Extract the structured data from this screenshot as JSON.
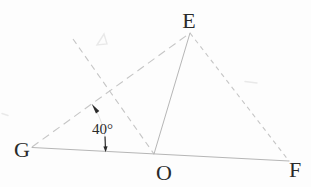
{
  "colors": {
    "bg": "#fdfdfd",
    "line": "#b6b6b6",
    "dash": "#c6c6c6",
    "ink": "#2a2a2a",
    "arc": "#e0e0e0",
    "artifact": "#e9e9e9"
  },
  "figure": {
    "type": "geometry-diagram",
    "canvas": {
      "width": 311,
      "height": 187
    },
    "points": {
      "E": {
        "x": 190,
        "y": 33
      },
      "G": {
        "x": 32,
        "y": 147
      },
      "O": {
        "x": 154,
        "y": 154
      },
      "F": {
        "x": 289,
        "y": 161
      },
      "ray_top": {
        "x": 73,
        "y": 39
      }
    },
    "segments": {
      "GF": {
        "x1": 32,
        "y1": 147.5,
        "x2": 289,
        "y2": 161,
        "style": "solid"
      },
      "EO": {
        "x1": 190,
        "y1": 33,
        "x2": 154,
        "y2": 154,
        "style": "solid"
      },
      "GE": {
        "x1": 32,
        "y1": 147,
        "x2": 190,
        "y2": 33,
        "style": "dashed"
      },
      "EF": {
        "x1": 190,
        "y1": 33,
        "x2": 289,
        "y2": 161,
        "style": "dashed"
      },
      "rayO": {
        "x1": 73,
        "y1": 39,
        "x2": 154,
        "y2": 154,
        "style": "dashed"
      }
    },
    "labels": {
      "E": {
        "text": "E",
        "x": 189,
        "y": 28
      },
      "G": {
        "text": "G",
        "x": 22,
        "y": 156.5
      },
      "O": {
        "text": "O",
        "x": 164,
        "y": 180
      },
      "F": {
        "text": "F",
        "x": 295,
        "y": 177
      }
    },
    "angle": {
      "text": "40°",
      "vertex": "G",
      "label_x": 92,
      "label_y": 134,
      "arc_path": "M 91.8 104.1 A 75 75 0 0 1 105.9 151.8",
      "arrow_top_points": "91.8,104.1 96.0,113.4 99.3,111.0",
      "arrow_bottom_points": "105.6,152.2 103.4,146.6 107.6,146.3",
      "arrow_tail": {
        "x1": 105.0,
        "y1": 136.5,
        "x2": 105.4,
        "y2": 147.0
      }
    },
    "artifacts": {
      "smudge_top": "97,45 104,34 107,44",
      "smudge_right": {
        "x1": 245,
        "y1": 81.5,
        "x2": 257,
        "y2": 83
      },
      "smudge_left": {
        "x1": 2,
        "y1": 113.5,
        "x2": 8,
        "y2": 115.5
      }
    }
  }
}
